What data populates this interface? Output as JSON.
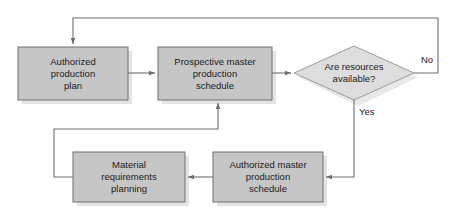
{
  "diagram": {
    "colors": {
      "process_fill": "#c6c6c6",
      "process_stroke": "#6e6e6e",
      "decision_fill": "#dddddd",
      "decision_stroke": "#9a9a9a",
      "shadow": "#e3e3e3",
      "connector": "#6e6e6e",
      "text": "#1a1a1a",
      "background": "#ffffff"
    },
    "nodes": [
      {
        "id": "authorized-production-plan",
        "type": "process",
        "lines": [
          "Authorized",
          "production",
          "plan"
        ],
        "x": 18,
        "y": 47,
        "w": 110,
        "h": 53
      },
      {
        "id": "prospective-master-production-schedule",
        "type": "process",
        "lines": [
          "Prospective master",
          "production",
          "schedule"
        ],
        "x": 158,
        "y": 47,
        "w": 114,
        "h": 53
      },
      {
        "id": "are-resources-available",
        "type": "decision",
        "lines": [
          "Are resources",
          "available?"
        ],
        "x": 294,
        "y": 46,
        "w": 120,
        "h": 54
      },
      {
        "id": "material-requirements-planning",
        "type": "process",
        "lines": [
          "Material",
          "requirements",
          "planning"
        ],
        "x": 73,
        "y": 152,
        "w": 112,
        "h": 50
      },
      {
        "id": "authorized-master-production-schedule",
        "type": "process",
        "lines": [
          "Authorized master",
          "production",
          "schedule"
        ],
        "x": 213,
        "y": 152,
        "w": 110,
        "h": 50
      }
    ],
    "edge_labels": [
      {
        "id": "no-label",
        "text": "No",
        "x": 421,
        "y": 54
      },
      {
        "id": "yes-label",
        "text": "Yes",
        "x": 359,
        "y": 106
      }
    ],
    "edges": [
      {
        "id": "plan-to-prospective",
        "from": "authorized-production-plan",
        "to": "prospective-master-production-schedule",
        "label": ""
      },
      {
        "id": "prospective-to-decision",
        "from": "prospective-master-production-schedule",
        "to": "are-resources-available",
        "label": ""
      },
      {
        "id": "decision-no-to-plan",
        "from": "are-resources-available",
        "to": "authorized-production-plan",
        "label": "No"
      },
      {
        "id": "decision-yes-to-authorized-mps",
        "from": "are-resources-available",
        "to": "authorized-master-production-schedule",
        "label": "Yes"
      },
      {
        "id": "authorized-mps-to-mrp",
        "from": "authorized-master-production-schedule",
        "to": "material-requirements-planning",
        "label": ""
      },
      {
        "id": "mrp-to-prospective",
        "from": "material-requirements-planning",
        "to": "prospective-master-production-schedule",
        "label": ""
      }
    ]
  }
}
